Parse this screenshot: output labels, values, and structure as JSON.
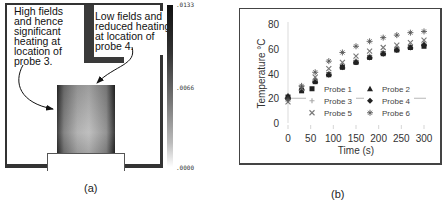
{
  "panel_a": {
    "caption": "(a)",
    "annotation_left": "High fields\nand hence\nsignificant\nheating at\nlocation of\nprobe 3.",
    "annotation_right": "Low fields and\nreduced heating\nat location of\nprobe 4.",
    "colorbar": {
      "max": ".0133",
      "mid": ".0066",
      "min": ".0000"
    }
  },
  "panel_b": {
    "caption": "(b)"
  },
  "chart_data": {
    "type": "scatter",
    "title": "",
    "xlabel": "Time (s)",
    "ylabel": "Temperature °C",
    "xlim": [
      0,
      300
    ],
    "ylim": [
      0,
      80
    ],
    "xticks": [
      0,
      50,
      100,
      150,
      200,
      250,
      300
    ],
    "yticks": [
      0,
      20,
      40,
      60,
      80
    ],
    "grid": false,
    "legend_position": "inside-center",
    "x": [
      0,
      30,
      60,
      90,
      120,
      150,
      180,
      210,
      240,
      270,
      300
    ],
    "series": [
      {
        "name": "Probe 1",
        "marker": "square",
        "values": [
          21,
          26,
          33,
          39,
          45,
          49,
          53,
          56,
          59,
          61,
          62
        ]
      },
      {
        "name": "Probe 2",
        "marker": "triangle",
        "values": [
          22,
          28,
          35,
          40,
          46,
          50,
          54,
          57,
          60,
          62,
          64
        ]
      },
      {
        "name": "Probe 3",
        "marker": "plus",
        "values": [
          18,
          27,
          34,
          40,
          45,
          50,
          54,
          57,
          60,
          62,
          64
        ]
      },
      {
        "name": "Probe 4",
        "marker": "diamond",
        "values": [
          20,
          27,
          33,
          39,
          45,
          49,
          53,
          56,
          59,
          61,
          63
        ]
      },
      {
        "name": "Probe 5",
        "marker": "x",
        "values": [
          17,
          28,
          37,
          44,
          49,
          54,
          58,
          61,
          63,
          65,
          67
        ]
      },
      {
        "name": "Probe 6",
        "marker": "asterisk",
        "values": [
          19,
          30,
          41,
          50,
          57,
          62,
          66,
          69,
          71,
          73,
          74
        ]
      }
    ]
  }
}
